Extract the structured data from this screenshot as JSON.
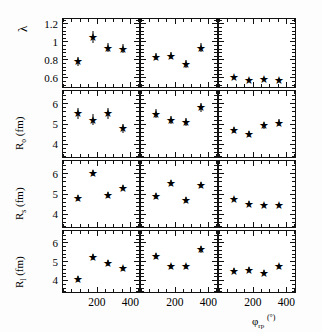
{
  "figure": {
    "kind": "multi-panel scatter",
    "rows": 4,
    "cols": 3,
    "xaxis_title_main": "φ",
    "xaxis_title_sub": "rp",
    "xaxis_title_unit": "(°)"
  },
  "chart_data": {
    "type": "scatter",
    "title": "",
    "xlabel": "φ_rp (°)",
    "ylabel": "",
    "xlim": [
      0,
      450
    ],
    "xticks": [
      200,
      400
    ],
    "xtick_labels": [
      "200",
      "400"
    ],
    "grid": false,
    "legend": "none",
    "marker": "star",
    "panels": [
      {
        "row": 0,
        "col": 0,
        "ylabel": "λ",
        "ylim": [
          0.5,
          1.25
        ],
        "yticks": [
          0.6,
          0.8,
          1.0,
          1.2
        ],
        "ytick_labels": [
          "0.6",
          "0.8",
          "1",
          "1.2"
        ],
        "x": [
          90,
          180,
          270,
          360
        ],
        "y": [
          0.78,
          1.05,
          0.93,
          0.92
        ],
        "yerr": [
          0.05,
          0.07,
          0.05,
          0.05
        ]
      },
      {
        "row": 0,
        "col": 1,
        "ylabel": "λ",
        "ylim": [
          0.5,
          1.25
        ],
        "yticks": [
          0.6,
          0.8,
          1.0,
          1.2
        ],
        "ytick_labels": [
          "0.6",
          "0.8",
          "1",
          "1.2"
        ],
        "x": [
          90,
          180,
          270,
          360
        ],
        "y": [
          0.83,
          0.84,
          0.75,
          0.93
        ],
        "yerr": [
          0.04,
          0.04,
          0.04,
          0.05
        ]
      },
      {
        "row": 0,
        "col": 2,
        "ylabel": "λ",
        "ylim": [
          0.5,
          1.25
        ],
        "yticks": [
          0.6,
          0.8,
          1.0,
          1.2
        ],
        "ytick_labels": [
          "0.6",
          "0.8",
          "1",
          "1.2"
        ],
        "x": [
          90,
          180,
          270,
          360
        ],
        "y": [
          0.6,
          0.575,
          0.58,
          0.57
        ],
        "yerr": [
          0.02,
          0.02,
          0.02,
          0.02
        ]
      },
      {
        "row": 1,
        "col": 0,
        "ylabel": "R_o (fm)",
        "ylim": [
          3.4,
          6.6
        ],
        "yticks": [
          4,
          5,
          6
        ],
        "ytick_labels": [
          "4",
          "5",
          "6"
        ],
        "x": [
          90,
          180,
          270,
          360
        ],
        "y": [
          5.5,
          5.2,
          5.5,
          4.78
        ],
        "yerr": [
          0.28,
          0.28,
          0.28,
          0.22
        ]
      },
      {
        "row": 1,
        "col": 1,
        "ylabel": "R_o (fm)",
        "ylim": [
          3.4,
          6.6
        ],
        "yticks": [
          4,
          5,
          6
        ],
        "ytick_labels": [
          "4",
          "5",
          "6"
        ],
        "x": [
          90,
          180,
          270,
          360
        ],
        "y": [
          5.48,
          5.18,
          5.1,
          5.8
        ],
        "yerr": [
          0.22,
          0.2,
          0.2,
          0.22
        ]
      },
      {
        "row": 1,
        "col": 2,
        "ylabel": "R_o (fm)",
        "ylim": [
          3.4,
          6.6
        ],
        "yticks": [
          4,
          5,
          6
        ],
        "ytick_labels": [
          "4",
          "5",
          "6"
        ],
        "x": [
          90,
          180,
          270,
          360
        ],
        "y": [
          4.7,
          4.5,
          4.92,
          5.05
        ],
        "yerr": [
          0.16,
          0.16,
          0.16,
          0.16
        ]
      },
      {
        "row": 2,
        "col": 0,
        "ylabel": "R_s (fm)",
        "ylim": [
          3.4,
          6.6
        ],
        "yticks": [
          4,
          5,
          6
        ],
        "ytick_labels": [
          "4",
          "5",
          "6"
        ],
        "x": [
          90,
          180,
          270,
          360
        ],
        "y": [
          4.78,
          6.02,
          4.92,
          5.3
        ],
        "yerr": [
          0.14,
          0.16,
          0.14,
          0.14
        ]
      },
      {
        "row": 2,
        "col": 1,
        "ylabel": "R_s (fm)",
        "ylim": [
          3.4,
          6.6
        ],
        "yticks": [
          4,
          5,
          6
        ],
        "ytick_labels": [
          "4",
          "5",
          "6"
        ],
        "x": [
          90,
          180,
          270,
          360
        ],
        "y": [
          4.9,
          5.52,
          4.7,
          5.42
        ],
        "yerr": [
          0.14,
          0.14,
          0.14,
          0.16
        ]
      },
      {
        "row": 2,
        "col": 2,
        "ylabel": "R_s (fm)",
        "ylim": [
          3.4,
          6.6
        ],
        "yticks": [
          4,
          5,
          6
        ],
        "ytick_labels": [
          "4",
          "5",
          "6"
        ],
        "x": [
          90,
          180,
          270,
          360
        ],
        "y": [
          4.75,
          4.52,
          4.45,
          4.45
        ],
        "yerr": [
          0.1,
          0.1,
          0.1,
          0.1
        ]
      },
      {
        "row": 3,
        "col": 0,
        "ylabel": "R_l (fm)",
        "ylim": [
          3.4,
          6.6
        ],
        "yticks": [
          4,
          5,
          6
        ],
        "ytick_labels": [
          "4",
          "5",
          "6"
        ],
        "x": [
          90,
          180,
          270,
          360
        ],
        "y": [
          4.05,
          5.22,
          4.9,
          4.62
        ],
        "yerr": [
          0.14,
          0.16,
          0.14,
          0.14
        ]
      },
      {
        "row": 3,
        "col": 1,
        "ylabel": "R_l (fm)",
        "ylim": [
          3.4,
          6.6
        ],
        "yticks": [
          4,
          5,
          6
        ],
        "ytick_labels": [
          "4",
          "5",
          "6"
        ],
        "x": [
          90,
          180,
          270,
          360
        ],
        "y": [
          5.3,
          4.72,
          4.72,
          5.62
        ],
        "yerr": [
          0.16,
          0.14,
          0.14,
          0.16
        ]
      },
      {
        "row": 3,
        "col": 2,
        "ylabel": "R_l (fm)",
        "ylim": [
          3.4,
          6.6
        ],
        "yticks": [
          4,
          5,
          6
        ],
        "ytick_labels": [
          "4",
          "5",
          "6"
        ],
        "x": [
          90,
          180,
          270,
          360
        ],
        "y": [
          4.5,
          4.55,
          4.4,
          4.72
        ],
        "yerr": [
          0.12,
          0.12,
          0.12,
          0.14
        ]
      }
    ],
    "row_axis_labels": [
      {
        "text": "λ",
        "main": "λ",
        "sub": "",
        "unit": ""
      },
      {
        "text": "R_o (fm)",
        "main": "R",
        "sub": "o",
        "unit": " (fm)"
      },
      {
        "text": "R_s (fm)",
        "main": "R",
        "sub": "s",
        "unit": " (fm)"
      },
      {
        "text": "R_l (fm)",
        "main": "R",
        "sub": "l",
        "unit": " (fm)"
      }
    ]
  }
}
